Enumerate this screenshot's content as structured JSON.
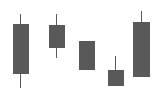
{
  "chart_data": {
    "type": "candlestick",
    "title": "",
    "subtitle": "",
    "xlabel": "",
    "ylabel": "",
    "grid": false,
    "legend": false,
    "axes_visible": false,
    "tick_labels": [],
    "background_color": "#ffffff",
    "body_color": "#595959",
    "wick_color": "#595959",
    "ylim": [
      0,
      100
    ],
    "y_axis_direction": "value-increases-upward",
    "categories": [
      "1",
      "2",
      "3",
      "4",
      "5"
    ],
    "candles": [
      {
        "index": 1,
        "label": "1",
        "open": 73,
        "high": 87,
        "low": 17,
        "close": 29,
        "direction": "down",
        "has_upper_wick": true,
        "has_lower_wick": true,
        "px": {
          "body_left": 13,
          "body_right": 29,
          "body_top": 24,
          "body_bottom": 74,
          "wick_center": 20.5,
          "wick_top": 14,
          "wick_bottom": 88
        }
      },
      {
        "index": 2,
        "label": "2",
        "open": 54,
        "high": 87,
        "low": 45,
        "close": 72,
        "direction": "up",
        "has_upper_wick": true,
        "has_lower_wick": true,
        "px": {
          "body_left": 49,
          "body_right": 65,
          "body_top": 25,
          "body_bottom": 48,
          "wick_center": 56.5,
          "wick_top": 14,
          "wick_bottom": 58
        }
      },
      {
        "index": 3,
        "label": "3",
        "open": 33,
        "high": 61,
        "low": 33,
        "close": 61,
        "direction": "up",
        "has_upper_wick": false,
        "has_lower_wick": false,
        "px": {
          "body_left": 79,
          "body_right": 95,
          "body_top": 41,
          "body_bottom": 70,
          "wick_center": 86.5,
          "wick_top": 41,
          "wick_bottom": 70
        }
      },
      {
        "index": 4,
        "label": "4",
        "open": 18,
        "high": 46,
        "low": 18,
        "close": 33,
        "direction": "up",
        "has_upper_wick": true,
        "has_lower_wick": false,
        "px": {
          "body_left": 108,
          "body_right": 124,
          "body_top": 70,
          "body_bottom": 86,
          "wick_center": 115.5,
          "wick_top": 56,
          "wick_bottom": 86
        }
      },
      {
        "index": 5,
        "label": "5",
        "open": 26,
        "high": 89,
        "low": 26,
        "close": 79,
        "direction": "up",
        "has_upper_wick": true,
        "has_lower_wick": false,
        "px": {
          "body_left": 133,
          "body_right": 150,
          "body_top": 22,
          "body_bottom": 77,
          "wick_center": 141.5,
          "wick_top": 11,
          "wick_bottom": 77
        }
      }
    ]
  }
}
